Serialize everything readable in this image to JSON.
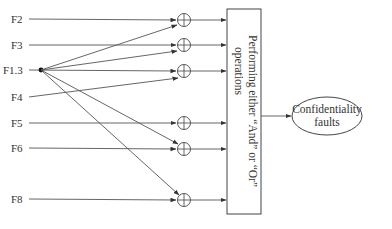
{
  "diagram": {
    "inputs": [
      {
        "label": "F2",
        "y": 19
      },
      {
        "label": "F3",
        "y": 45
      },
      {
        "label": "F1.3",
        "y": 70
      },
      {
        "label": "F4",
        "y": 97
      },
      {
        "label": "F5",
        "y": 123
      },
      {
        "label": "F6",
        "y": 148
      },
      {
        "label": "F8",
        "y": 199
      }
    ],
    "xor_gates": [
      {
        "id": "xor-1",
        "y": 20
      },
      {
        "id": "xor-2",
        "y": 45
      },
      {
        "id": "xor-3",
        "y": 71
      },
      {
        "id": "xor-4",
        "y": 123
      },
      {
        "id": "xor-5",
        "y": 149
      },
      {
        "id": "xor-6",
        "y": 200
      }
    ],
    "process_box": {
      "line1": "Performing either “And” or “Or”",
      "line2": "operations"
    },
    "output": {
      "line1": "Confidentiality",
      "line2": "faults"
    },
    "colors": {
      "line": "#555555",
      "text": "#333333",
      "background": "#ffffff"
    }
  }
}
